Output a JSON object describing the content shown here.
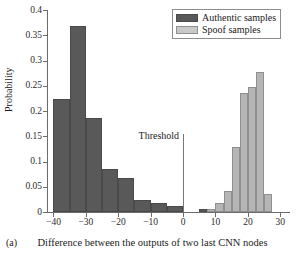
{
  "panel": {
    "caption": "(a)"
  },
  "chart_data": {
    "type": "bar",
    "title": "",
    "subtitle": "",
    "xlabel": "Difference between the outputs of two last CNN nodes",
    "ylabel": "Probability",
    "xlim": [
      -42,
      33
    ],
    "ylim": [
      0,
      0.4
    ],
    "grid": false,
    "legend_position": "top-right",
    "xticks": [
      -40,
      -30,
      -20,
      -10,
      0,
      10,
      20,
      30
    ],
    "xtick_labels": [
      "−40",
      "−30",
      "−20",
      "−10",
      "0",
      "10",
      "20",
      "30"
    ],
    "yticks": [
      0,
      0.05,
      0.1,
      0.15,
      0.2,
      0.25,
      0.3,
      0.35,
      0.4
    ],
    "ytick_labels": [
      "0",
      "0.05",
      "0.1",
      "0.15",
      "0.2",
      "0.25",
      "0.3",
      "0.35",
      "0.4"
    ],
    "annotations": [
      {
        "name": "threshold",
        "label": "Threshold",
        "x": 0,
        "type": "vline",
        "y_top": 0.155
      }
    ],
    "series": [
      {
        "name": "Authentic samples",
        "color": "#595959",
        "bin_width": 5,
        "bins": [
          {
            "x_left": -40,
            "x_right": -35,
            "value": 0.224
          },
          {
            "x_left": -35,
            "x_right": -30,
            "value": 0.368
          },
          {
            "x_left": -30,
            "x_right": -25,
            "value": 0.187
          },
          {
            "x_left": -25,
            "x_right": -20,
            "value": 0.086
          },
          {
            "x_left": -20,
            "x_right": -15,
            "value": 0.067
          },
          {
            "x_left": -15,
            "x_right": -10,
            "value": 0.024
          },
          {
            "x_left": -10,
            "x_right": -5,
            "value": 0.018
          },
          {
            "x_left": -5,
            "x_right": 0,
            "value": 0.012
          },
          {
            "x_left": 5,
            "x_right": 7.5,
            "value": 0.006
          }
        ]
      },
      {
        "name": "Spoof samples",
        "color": "#b5b5b5",
        "bin_width": 2.5,
        "bins": [
          {
            "x_left": 7.5,
            "x_right": 10,
            "value": 0.006
          },
          {
            "x_left": 10,
            "x_right": 12.5,
            "value": 0.017
          },
          {
            "x_left": 12.5,
            "x_right": 15,
            "value": 0.042
          },
          {
            "x_left": 15,
            "x_right": 17.5,
            "value": 0.128
          },
          {
            "x_left": 17.5,
            "x_right": 20,
            "value": 0.236
          },
          {
            "x_left": 20,
            "x_right": 22.5,
            "value": 0.248
          },
          {
            "x_left": 22.5,
            "x_right": 25,
            "value": 0.278
          },
          {
            "x_left": 25,
            "x_right": 27.5,
            "value": 0.035
          }
        ]
      }
    ]
  },
  "legend": {
    "entries": [
      {
        "label": "Authentic samples",
        "swatch": "authentic"
      },
      {
        "label": "Spoof samples",
        "swatch": "spoof"
      }
    ]
  }
}
